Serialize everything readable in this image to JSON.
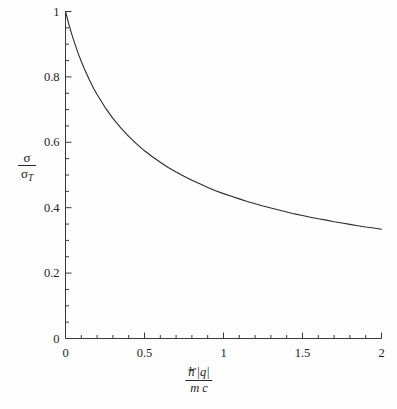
{
  "figure": {
    "background_color": "#fdfdfd",
    "curve_color": "#2b2b2b",
    "axis_color": "#3a3a3a"
  },
  "axes": {
    "x": {
      "title_numerator": "ħ |q|",
      "title_denominator": "m c",
      "tick_labels": [
        "0",
        "0.5",
        "1",
        "1.5",
        "2"
      ],
      "tick_values": [
        0,
        0.5,
        1,
        1.5,
        2
      ],
      "minor_tick_step": 0.1,
      "range": [
        0,
        2
      ]
    },
    "y": {
      "title_numerator": "σ",
      "title_denominator_base": "σ",
      "title_denominator_sub": "T",
      "tick_labels": [
        "0",
        "0.2",
        "0.4",
        "0.6",
        "0.8",
        "1"
      ],
      "tick_values": [
        0,
        0.2,
        0.4,
        0.6,
        0.8,
        1
      ],
      "minor_tick_step": 0.05,
      "range": [
        0,
        1
      ]
    }
  },
  "chart_data": {
    "type": "line",
    "title": "",
    "subtitle": "",
    "xlabel": "ħ |q| / (m c)",
    "ylabel": "σ / σ_T",
    "xlim": [
      0,
      2
    ],
    "ylim": [
      0,
      1
    ],
    "grid": false,
    "legend": null,
    "legend_position": "none",
    "annotations": [],
    "series": [
      {
        "name": "Klein-Nishina cross section ratio",
        "color": "#2b2b2b",
        "line_width": 1.1,
        "x": [
          0.0,
          0.02,
          0.04,
          0.06,
          0.08,
          0.1,
          0.12,
          0.15,
          0.18,
          0.2,
          0.25,
          0.3,
          0.35,
          0.4,
          0.45,
          0.5,
          0.55,
          0.6,
          0.65,
          0.7,
          0.75,
          0.8,
          0.85,
          0.9,
          0.95,
          1.0,
          1.05,
          1.1,
          1.15,
          1.2,
          1.25,
          1.3,
          1.35,
          1.4,
          1.45,
          1.5,
          1.55,
          1.6,
          1.65,
          1.7,
          1.75,
          1.8,
          1.85,
          1.9,
          1.95,
          2.0
        ],
        "y": [
          1.0,
          0.963,
          0.93,
          0.9,
          0.872,
          0.847,
          0.824,
          0.792,
          0.763,
          0.746,
          0.707,
          0.673,
          0.644,
          0.618,
          0.595,
          0.574,
          0.556,
          0.539,
          0.523,
          0.509,
          0.496,
          0.484,
          0.473,
          0.462,
          0.452,
          0.443,
          0.435,
          0.427,
          0.419,
          0.412,
          0.405,
          0.399,
          0.393,
          0.387,
          0.381,
          0.376,
          0.371,
          0.366,
          0.362,
          0.357,
          0.353,
          0.349,
          0.345,
          0.341,
          0.338,
          0.334
        ]
      }
    ]
  }
}
